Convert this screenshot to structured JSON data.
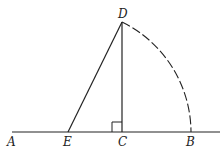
{
  "diagram": {
    "labels": {
      "A": "A",
      "E": "E",
      "C": "C",
      "B": "B",
      "D": "D"
    },
    "points": {
      "A": [
        12,
        132
      ],
      "E": [
        68,
        132
      ],
      "C": [
        122,
        132
      ],
      "B": [
        191,
        132
      ],
      "D": [
        122,
        22
      ]
    },
    "elements": [
      "line AB (baseline)",
      "segment ED",
      "segment DC perpendicular to AB",
      "right-angle mark at C",
      "dashed arc DB centered at E"
    ],
    "colors": {
      "stroke": "#222222",
      "background": "#ffffff"
    }
  }
}
